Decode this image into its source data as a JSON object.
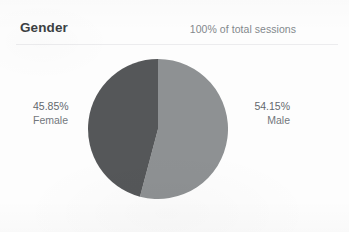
{
  "card": {
    "title": "Gender",
    "subtitle": "100% of total sessions"
  },
  "chart_data": {
    "type": "pie",
    "title": "Gender",
    "subtitle": "100% of total sessions",
    "categories": [
      "Male",
      "Female"
    ],
    "values": [
      54.15,
      45.85
    ],
    "value_labels": [
      "54.15%",
      "45.85%"
    ],
    "unit": "percent",
    "start_angle_deg": 0,
    "direction": "clockwise",
    "legend": "none",
    "grid": false,
    "slices": [
      {
        "name": "Male",
        "value": 54.15,
        "label": "54.15%",
        "color": "#8e9193",
        "sweep_deg": 194.94,
        "label_position": "right"
      },
      {
        "name": "Female",
        "value": 45.85,
        "label": "45.85%",
        "color": "#555759",
        "sweep_deg": 165.06,
        "label_position": "left"
      }
    ]
  },
  "labels": {
    "female": {
      "percent": "45.85%",
      "name": "Female"
    },
    "male": {
      "percent": "54.15%",
      "name": "Male"
    }
  },
  "colors": {
    "male_slice": "#8e9193",
    "female_slice": "#555759",
    "title_text": "#3b3f43",
    "subtitle_text": "#83888c",
    "label_text": "#6e7378",
    "divider": "#ececee",
    "background": "#fdfdfd"
  }
}
